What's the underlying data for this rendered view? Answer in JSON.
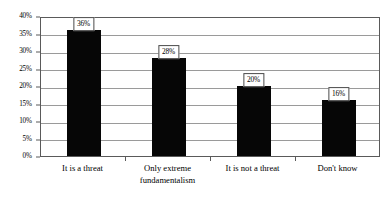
{
  "chart_data": {
    "type": "bar",
    "title": "",
    "subtitle": "",
    "xlabel": "",
    "ylabel": "",
    "categories": [
      "It is a threat",
      "Only extreme fundamentalism",
      "It is not a threat",
      "Don't know"
    ],
    "values": [
      36,
      28,
      20,
      16
    ],
    "data_labels": [
      "36%",
      "28%",
      "20%",
      "16%"
    ],
    "ylim": [
      0,
      40
    ],
    "ytick_values": [
      0,
      5,
      10,
      15,
      20,
      25,
      30,
      35,
      40
    ],
    "ytick_labels": [
      "0%",
      "5%",
      "10%",
      "15%",
      "20%",
      "25%",
      "30%",
      "35%",
      "40%"
    ],
    "grid": true,
    "grid_axis": "y",
    "legend": false,
    "legend_position": "none",
    "bar_color": "#060606",
    "gridline_color": "#9a9a9a",
    "axis_color": "#5a5a5a",
    "background_color": "#ffffff",
    "annotations": []
  },
  "category_label_lines": [
    [
      "It is a threat"
    ],
    [
      "Only extreme",
      "fundamentalism"
    ],
    [
      "It is not a threat"
    ],
    [
      "Don't know"
    ]
  ]
}
